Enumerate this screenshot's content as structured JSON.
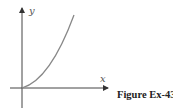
{
  "figure": {
    "caption": "Figure Ex-43",
    "x_axis_label": "x",
    "y_axis_label": "y",
    "curve_color": "#888888",
    "axis_color": "#444444",
    "curve_description": "increasing, concave-up curve starting at the origin"
  }
}
